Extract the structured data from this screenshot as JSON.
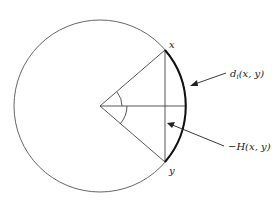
{
  "diagram": {
    "type": "geometry",
    "labels": {
      "point_x": "x",
      "point_y": "y",
      "arc_label": "d",
      "arc_label_sub": "i",
      "arc_label_args": "(x, y)",
      "chord_label": "−H(x, y)"
    },
    "colors": {
      "stroke": "#555555",
      "arc_highlight": "#111111",
      "background": "#ffffff"
    }
  }
}
